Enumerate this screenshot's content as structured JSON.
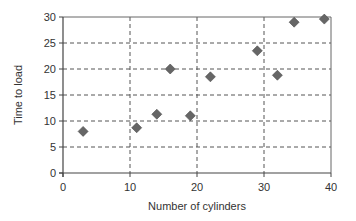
{
  "chart_data": {
    "type": "scatter",
    "title": "",
    "xlabel": "Number of cylinders",
    "ylabel": "Time to load",
    "xlim": [
      0,
      40
    ],
    "ylim": [
      0,
      30
    ],
    "x_ticks": [
      0,
      10,
      20,
      30,
      40
    ],
    "y_ticks": [
      0,
      5,
      10,
      15,
      20,
      25,
      30
    ],
    "grid": {
      "x": true,
      "y": true,
      "style": "dashed"
    },
    "legend": null,
    "marker": "diamond",
    "series": [
      {
        "name": "Time to load",
        "color": "#666666",
        "points": [
          {
            "x": 3,
            "y": 8
          },
          {
            "x": 11,
            "y": 8.7
          },
          {
            "x": 14,
            "y": 11.3
          },
          {
            "x": 16,
            "y": 20
          },
          {
            "x": 19,
            "y": 11
          },
          {
            "x": 22,
            "y": 18.5
          },
          {
            "x": 29,
            "y": 23.5
          },
          {
            "x": 32,
            "y": 18.8
          },
          {
            "x": 34.5,
            "y": 29
          },
          {
            "x": 39,
            "y": 29.6
          }
        ]
      }
    ]
  }
}
